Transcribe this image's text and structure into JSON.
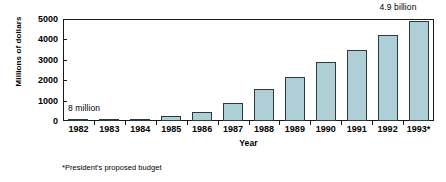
{
  "chart_data": {
    "type": "bar",
    "title": "",
    "subtitle": "",
    "xlabel": "Year",
    "ylabel": "Millions of dollars",
    "categories": [
      "1982",
      "1983",
      "1984",
      "1985",
      "1986",
      "1987",
      "1988",
      "1989",
      "1990",
      "1991",
      "1992",
      "1993*"
    ],
    "values": [
      8,
      60,
      90,
      230,
      420,
      880,
      1560,
      2180,
      2880,
      3500,
      4210,
      4900
    ],
    "ylim": [
      0,
      5000
    ],
    "yticks": [
      0,
      1000,
      2000,
      3000,
      4000,
      5000
    ],
    "ytick_labels": [
      "0",
      "1000",
      "2000",
      "3000",
      "4000",
      "5000"
    ],
    "grid": false,
    "legend": false,
    "legend_position": "none",
    "bar_color": "#aecfd6",
    "bar_border_color": "#2b3a3d",
    "axis_color": "#1a1a1a",
    "annotations": [
      {
        "name": "first-bar-value",
        "text": "8 million",
        "refers_to": "1982"
      },
      {
        "name": "last-bar-value",
        "text": "4.9 billion",
        "refers_to": "1993*"
      }
    ],
    "footnote": "*President's proposed budget"
  }
}
